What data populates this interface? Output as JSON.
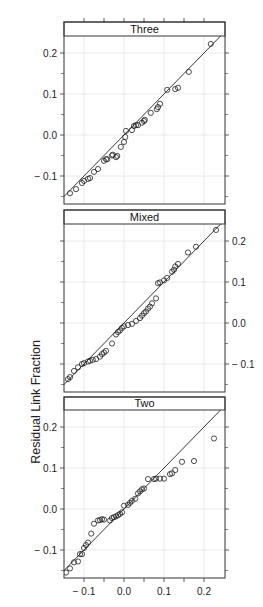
{
  "chart_data": {
    "type": "scatter",
    "subtype": "qq-plot (trellis, 3 panels stacked vertically, shared x axis)",
    "title": "",
    "xlabel": "",
    "ylabel": "Residual Link Fraction",
    "xlim": [
      -0.15,
      0.2525
    ],
    "ylim": [
      -0.16,
      0.245
    ],
    "x_ticks": [
      -0.1,
      0.0,
      0.1,
      0.2
    ],
    "x_tick_labels": [
      "-0.1",
      "0.0",
      "0.1",
      "0.2"
    ],
    "y_ticks": [
      -0.1,
      0.0,
      0.1,
      0.2
    ],
    "y_tick_labels": [
      "-0.1",
      "0.0",
      "0.1",
      "0.2"
    ],
    "grid": true,
    "reference_line": "y = x",
    "marker": "open circle",
    "panels": [
      {
        "name": "Three",
        "y_axis_side": "left",
        "points": [
          [
            -0.135,
            -0.142
          ],
          [
            -0.12,
            -0.132
          ],
          [
            -0.105,
            -0.117
          ],
          [
            -0.1,
            -0.112
          ],
          [
            -0.09,
            -0.107
          ],
          [
            -0.085,
            -0.105
          ],
          [
            -0.075,
            -0.09
          ],
          [
            -0.065,
            -0.083
          ],
          [
            -0.05,
            -0.063
          ],
          [
            -0.045,
            -0.059
          ],
          [
            -0.042,
            -0.059
          ],
          [
            -0.02,
            -0.054
          ],
          [
            -0.017,
            -0.051
          ],
          [
            -0.008,
            -0.029
          ],
          [
            0.0,
            -0.017
          ],
          [
            0.003,
            -0.005
          ],
          [
            0.005,
            0.01
          ],
          [
            0.02,
            0.012
          ],
          [
            0.025,
            0.022
          ],
          [
            0.03,
            0.024
          ],
          [
            0.035,
            0.024
          ],
          [
            0.05,
            0.034
          ],
          [
            0.052,
            0.037
          ],
          [
            0.067,
            0.054
          ],
          [
            0.082,
            0.063
          ],
          [
            0.085,
            0.068
          ],
          [
            0.09,
            0.076
          ],
          [
            0.108,
            0.11
          ],
          [
            0.128,
            0.112
          ],
          [
            0.135,
            0.115
          ],
          [
            0.162,
            0.154
          ],
          [
            0.217,
            0.222
          ],
          [
            -0.03,
            -0.05
          ],
          [
            -0.028,
            -0.048
          ],
          [
            0.045,
            0.03
          ]
        ]
      },
      {
        "name": "Mixed",
        "y_axis_side": "right",
        "points": [
          [
            -0.14,
            -0.137
          ],
          [
            -0.135,
            -0.132
          ],
          [
            -0.125,
            -0.117
          ],
          [
            -0.115,
            -0.108
          ],
          [
            -0.105,
            -0.1
          ],
          [
            -0.1,
            -0.098
          ],
          [
            -0.09,
            -0.094
          ],
          [
            -0.085,
            -0.092
          ],
          [
            -0.078,
            -0.09
          ],
          [
            -0.07,
            -0.088
          ],
          [
            -0.06,
            -0.082
          ],
          [
            -0.055,
            -0.076
          ],
          [
            -0.05,
            -0.072
          ],
          [
            -0.045,
            -0.068
          ],
          [
            -0.03,
            -0.05
          ],
          [
            -0.02,
            -0.028
          ],
          [
            -0.015,
            -0.022
          ],
          [
            -0.01,
            -0.018
          ],
          [
            -0.005,
            -0.012
          ],
          [
            0.0,
            -0.008
          ],
          [
            0.01,
            -0.005
          ],
          [
            0.02,
            -0.002
          ],
          [
            0.03,
            0.005
          ],
          [
            0.04,
            0.012
          ],
          [
            0.045,
            0.018
          ],
          [
            0.05,
            0.024
          ],
          [
            0.055,
            0.028
          ],
          [
            0.06,
            0.035
          ],
          [
            0.065,
            0.04
          ],
          [
            0.07,
            0.048
          ],
          [
            0.08,
            0.06
          ],
          [
            0.085,
            0.097
          ],
          [
            0.09,
            0.099
          ],
          [
            0.1,
            0.104
          ],
          [
            0.108,
            0.11
          ],
          [
            0.12,
            0.125
          ],
          [
            0.125,
            0.13
          ],
          [
            0.128,
            0.138
          ],
          [
            0.135,
            0.144
          ],
          [
            0.16,
            0.172
          ],
          [
            0.18,
            0.186
          ],
          [
            0.23,
            0.227
          ]
        ]
      },
      {
        "name": "Two",
        "y_axis_side": "left",
        "points": [
          [
            -0.145,
            -0.155
          ],
          [
            -0.135,
            -0.145
          ],
          [
            -0.125,
            -0.13
          ],
          [
            -0.115,
            -0.128
          ],
          [
            -0.11,
            -0.11
          ],
          [
            -0.105,
            -0.11
          ],
          [
            -0.1,
            -0.095
          ],
          [
            -0.095,
            -0.088
          ],
          [
            -0.09,
            -0.082
          ],
          [
            -0.082,
            -0.06
          ],
          [
            -0.075,
            -0.036
          ],
          [
            -0.065,
            -0.028
          ],
          [
            -0.06,
            -0.027
          ],
          [
            -0.055,
            -0.025
          ],
          [
            -0.05,
            -0.026
          ],
          [
            -0.035,
            -0.028
          ],
          [
            -0.03,
            -0.022
          ],
          [
            -0.025,
            -0.02
          ],
          [
            -0.02,
            -0.018
          ],
          [
            -0.015,
            -0.015
          ],
          [
            -0.01,
            -0.012
          ],
          [
            -0.005,
            -0.008
          ],
          [
            0.0,
            0.008
          ],
          [
            0.01,
            0.01
          ],
          [
            0.015,
            0.015
          ],
          [
            0.02,
            0.02
          ],
          [
            0.028,
            0.025
          ],
          [
            0.035,
            0.038
          ],
          [
            0.04,
            0.043
          ],
          [
            0.045,
            0.048
          ],
          [
            0.05,
            0.05
          ],
          [
            0.06,
            0.073
          ],
          [
            0.075,
            0.073
          ],
          [
            0.08,
            0.074
          ],
          [
            0.09,
            0.074
          ],
          [
            0.1,
            0.074
          ],
          [
            0.115,
            0.085
          ],
          [
            0.12,
            0.087
          ],
          [
            0.128,
            0.095
          ],
          [
            0.145,
            0.115
          ],
          [
            0.175,
            0.117
          ],
          [
            0.225,
            0.172
          ]
        ]
      }
    ]
  }
}
